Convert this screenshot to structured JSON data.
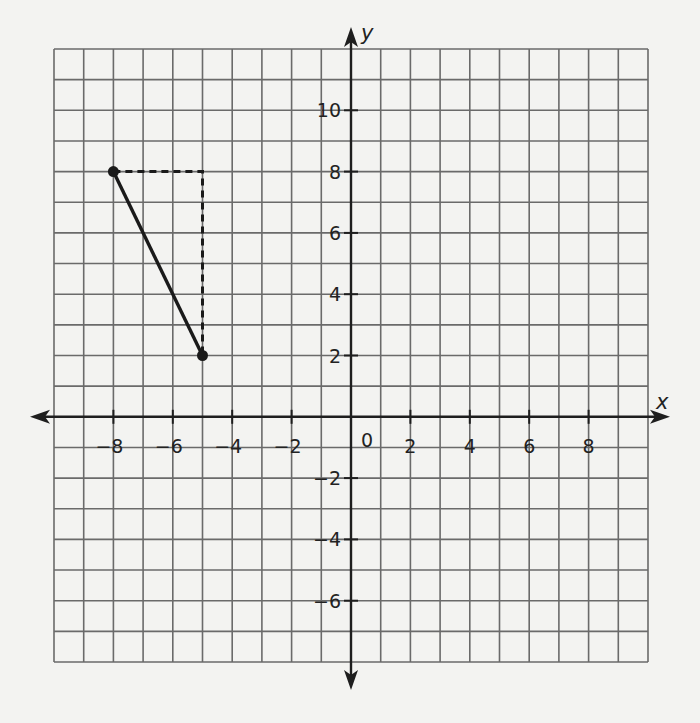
{
  "chart_data": {
    "type": "line",
    "title": "",
    "xlabel": "x",
    "ylabel": "y",
    "xlim": [
      -10,
      10
    ],
    "ylim": [
      -8,
      12
    ],
    "grid": true,
    "grid_step": 1,
    "x_ticks": [
      -8,
      -6,
      -4,
      -2,
      2,
      4,
      6,
      8
    ],
    "x_tick_labels": [
      "−8",
      "−6",
      "−4",
      "−2",
      "2",
      "4",
      "6",
      "8"
    ],
    "y_ticks": [
      10,
      8,
      6,
      4,
      2,
      -2,
      -4,
      -6
    ],
    "y_tick_labels": [
      "10",
      "8",
      "6",
      "4",
      "2",
      "−2",
      "−4",
      "−6"
    ],
    "origin_label": "0",
    "points": [
      {
        "x": -8,
        "y": 8
      },
      {
        "x": -5,
        "y": 2
      }
    ],
    "series": [
      {
        "name": "segment",
        "style": "solid",
        "x": [
          -8,
          -5
        ],
        "y": [
          8,
          2
        ]
      },
      {
        "name": "rise-run",
        "style": "dashed",
        "x": [
          -8,
          -5,
          -5
        ],
        "y": [
          8,
          8,
          2
        ]
      }
    ]
  },
  "colors": {
    "background": "#f3f3f1",
    "grid": "#6a6a6a",
    "axis": "#1e1e1e",
    "segment": "#1a1a1a"
  }
}
